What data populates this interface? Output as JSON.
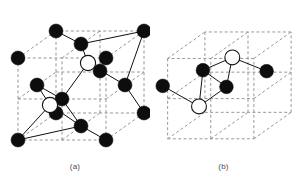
{
  "figure": {
    "background_color": "#ffffff",
    "width": 297,
    "height": 189
  },
  "colors": {
    "filled_atom": "#0d0d0d",
    "open_atom_fill": "#ffffff",
    "open_atom_stroke": "#111111",
    "cell_edge": "#8a8a8a",
    "bond": "#111111",
    "caption": "#4a4a4a"
  },
  "legend": {
    "filled_atom_label": "host lattice atom",
    "open_atom_label": "interstitial site atom"
  },
  "panels": [
    {
      "id": "a",
      "caption": "(a)",
      "description": "Face-centred cubic unit cell with two tetrahedral interstitial sites",
      "filled_atom_count": 14,
      "open_atom_count": 2,
      "atom_radius_filled": 7.0,
      "atom_radius_open": 7.6,
      "cell": {
        "front_bottom_left": [
          18,
          140
        ],
        "front_bottom_right": [
          106,
          140
        ],
        "front_top_left": [
          18,
          58
        ],
        "front_top_right": [
          106,
          58
        ],
        "back_bottom_left": [
          56,
          113
        ],
        "back_bottom_right": [
          144,
          113
        ],
        "back_top_left": [
          56,
          31
        ],
        "back_top_right": [
          144,
          31
        ]
      },
      "filled_atoms": [
        {
          "name": "corner-front-bottom-left",
          "x": 18,
          "y": 140
        },
        {
          "name": "corner-front-bottom-right",
          "x": 106,
          "y": 140
        },
        {
          "name": "corner-front-top-left",
          "x": 18,
          "y": 58
        },
        {
          "name": "corner-front-top-right",
          "x": 106,
          "y": 58
        },
        {
          "name": "corner-back-bottom-left",
          "x": 56,
          "y": 113
        },
        {
          "name": "corner-back-bottom-right",
          "x": 144,
          "y": 113
        },
        {
          "name": "corner-back-top-left",
          "x": 56,
          "y": 31
        },
        {
          "name": "corner-back-top-right",
          "x": 144,
          "y": 31
        },
        {
          "name": "face-centre-front",
          "x": 62,
          "y": 99
        },
        {
          "name": "face-centre-top",
          "x": 81,
          "y": 44
        },
        {
          "name": "face-centre-bottom",
          "x": 81,
          "y": 126
        },
        {
          "name": "face-centre-left",
          "x": 37,
          "y": 85
        },
        {
          "name": "face-centre-right",
          "x": 125,
          "y": 85
        },
        {
          "name": "face-centre-back",
          "x": 100,
          "y": 71
        }
      ],
      "open_atoms": [
        {
          "name": "interstitial-upper",
          "x": 88,
          "y": 63
        },
        {
          "name": "interstitial-lower",
          "x": 50,
          "y": 105
        }
      ],
      "bonds": [
        {
          "from": [
            88,
            63
          ],
          "to": [
            81,
            44
          ]
        },
        {
          "from": [
            88,
            63
          ],
          "to": [
            125,
            85
          ]
        },
        {
          "from": [
            88,
            63
          ],
          "to": [
            62,
            99
          ]
        },
        {
          "from": [
            88,
            63
          ],
          "to": [
            100,
            71
          ]
        },
        {
          "from": [
            81,
            44
          ],
          "to": [
            56,
            31
          ]
        },
        {
          "from": [
            81,
            44
          ],
          "to": [
            144,
            31
          ]
        },
        {
          "from": [
            125,
            85
          ],
          "to": [
            144,
            31
          ]
        },
        {
          "from": [
            125,
            85
          ],
          "to": [
            144,
            113
          ]
        },
        {
          "from": [
            62,
            99
          ],
          "to": [
            37,
            85
          ]
        },
        {
          "from": [
            50,
            105
          ],
          "to": [
            37,
            85
          ]
        },
        {
          "from": [
            50,
            105
          ],
          "to": [
            62,
            99
          ]
        },
        {
          "from": [
            50,
            105
          ],
          "to": [
            81,
            126
          ]
        },
        {
          "from": [
            50,
            105
          ],
          "to": [
            18,
            140
          ]
        },
        {
          "from": [
            81,
            126
          ],
          "to": [
            18,
            140
          ]
        },
        {
          "from": [
            81,
            126
          ],
          "to": [
            106,
            140
          ]
        },
        {
          "from": [
            81,
            126
          ],
          "to": [
            62,
            99
          ]
        }
      ]
    },
    {
      "id": "b",
      "caption": "(b)",
      "description": "Same unit cell showing only the interstitial tetrahedra",
      "filled_atom_count": 4,
      "open_atom_count": 2,
      "atom_radius_filled": 7.0,
      "atom_radius_open": 7.6,
      "cell": {
        "front_bottom_left": [
          18,
          140
        ],
        "front_bottom_right": [
          106,
          140
        ],
        "front_top_left": [
          18,
          58
        ],
        "front_top_right": [
          106,
          58
        ],
        "back_bottom_left": [
          56,
          113
        ],
        "back_bottom_right": [
          144,
          113
        ],
        "back_top_left": [
          56,
          31
        ],
        "back_top_right": [
          144,
          31
        ]
      },
      "filled_atoms": [
        {
          "name": "atom-left",
          "x": 13,
          "y": 86
        },
        {
          "name": "atom-upper-mid",
          "x": 54,
          "y": 70
        },
        {
          "name": "atom-lower-mid",
          "x": 78,
          "y": 87
        },
        {
          "name": "atom-right",
          "x": 119,
          "y": 71
        }
      ],
      "open_atoms": [
        {
          "name": "interstitial-upper",
          "x": 84,
          "y": 57
        },
        {
          "name": "interstitial-lower",
          "x": 50,
          "y": 107
        }
      ],
      "bonds": [
        {
          "from": [
            84,
            57
          ],
          "to": [
            54,
            70
          ]
        },
        {
          "from": [
            84,
            57
          ],
          "to": [
            78,
            87
          ]
        },
        {
          "from": [
            84,
            57
          ],
          "to": [
            119,
            71
          ]
        },
        {
          "from": [
            50,
            107
          ],
          "to": [
            13,
            86
          ]
        },
        {
          "from": [
            50,
            107
          ],
          "to": [
            54,
            70
          ]
        },
        {
          "from": [
            50,
            107
          ],
          "to": [
            78,
            87
          ]
        },
        {
          "from": [
            54,
            70
          ],
          "to": [
            78,
            87
          ]
        }
      ]
    }
  ]
}
